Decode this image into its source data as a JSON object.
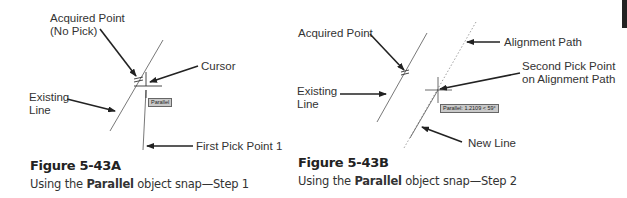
{
  "figure_a": {
    "labels": {
      "acquired_point_line1": "Acquired Point",
      "acquired_point_line2": "(No Pick)",
      "cursor": "Cursor",
      "existing_line_1": "Existing",
      "existing_line_2": "Line",
      "first_pick_point": "First Pick Point 1"
    },
    "tooltip": "Parallel",
    "caption_title": "Figure 5-43A",
    "caption_pre": "Using the ",
    "caption_bold": "Parallel",
    "caption_post": " object snap—Step 1"
  },
  "figure_b": {
    "labels": {
      "acquired_point": "Acquired Point",
      "alignment_path": "Alignment Path",
      "second_pick_line1": "Second Pick Point",
      "second_pick_line2": "on Alignment Path",
      "existing_line_1": "Existing",
      "existing_line_2": "Line",
      "new_line": "New Line"
    },
    "tooltip": "Parallel: 1.2109 < 59°",
    "caption_title": "Figure 5-43B",
    "caption_pre": "Using the ",
    "caption_bold": "Parallel",
    "caption_post": " object snap—Step 2"
  },
  "colors": {
    "line": "#555555",
    "arrow": "#222222",
    "tooltip_bg": "#c9c9c9"
  }
}
